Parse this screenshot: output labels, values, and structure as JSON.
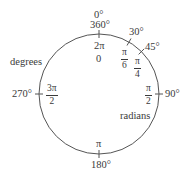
{
  "diagram": {
    "type": "unit-circle-angle-conversion",
    "circle": {
      "cx": 99,
      "cy": 94,
      "r": 60,
      "stroke": "#555555"
    },
    "labels": {
      "degrees_caption": "degrees",
      "radians_caption": "radians"
    },
    "degree_marks": {
      "top_0": "0°",
      "top_360": "360°",
      "d30": "30°",
      "d45": "45°",
      "d90": "90°",
      "d180": "180°",
      "d270": "270°"
    },
    "radian_marks": {
      "top_2pi": "2π",
      "top_0": "0",
      "pi_over_6": {
        "num": "π",
        "den": "6"
      },
      "pi_over_4": {
        "num": "π",
        "den": "4"
      },
      "pi_over_2": {
        "num": "π",
        "den": "2"
      },
      "pi": "π",
      "three_pi_over_2": {
        "num": "3π",
        "den": "2"
      }
    }
  }
}
